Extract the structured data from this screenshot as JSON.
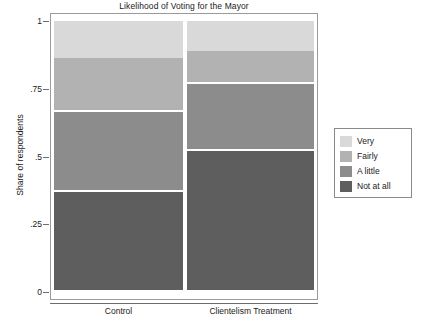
{
  "chart_data": {
    "type": "bar",
    "subtype": "stacked-100-percent",
    "title": "Likelihood of Voting for the Mayor",
    "xlabel": "",
    "ylabel": "Share of respondents",
    "categories": [
      "Control",
      "Clientelism Treatment"
    ],
    "ylim": [
      0,
      1
    ],
    "ytick_labels": [
      "1",
      ".75",
      ".5",
      ".25",
      "0"
    ],
    "ytick_values": [
      1,
      0.75,
      0.5,
      0.25,
      0
    ],
    "grid": false,
    "legend_position": "right",
    "stack_order_bottom_to_top": [
      "Not at all",
      "A little",
      "Fairly",
      "Very"
    ],
    "series": [
      {
        "name": "Very",
        "color": "#d9d9d9",
        "values": [
          0.135,
          0.109
        ]
      },
      {
        "name": "Fairly",
        "color": "#b2b2b2",
        "values": [
          0.201,
          0.125
        ]
      },
      {
        "name": "A little",
        "color": "#8c8c8c",
        "values": [
          0.295,
          0.244
        ]
      },
      {
        "name": "Not at all",
        "color": "#5e5e5e",
        "values": [
          0.369,
          0.522
        ]
      }
    ],
    "cumulative_boundaries": {
      "Control": [
        1.0,
        0.865,
        0.664,
        0.369,
        0.0
      ],
      "Clientelism Treatment": [
        1.0,
        0.891,
        0.766,
        0.522,
        0.0
      ]
    }
  },
  "legend": {
    "items": [
      {
        "label": "Very",
        "color": "#d9d9d9"
      },
      {
        "label": "Fairly",
        "color": "#b2b2b2"
      },
      {
        "label": "A little",
        "color": "#8c8c8c"
      },
      {
        "label": "Not at all",
        "color": "#5e5e5e"
      }
    ]
  },
  "axes": {
    "y_title": "Share of respondents",
    "y_ticks": [
      {
        "label": "1",
        "value": 1
      },
      {
        "label": ".75",
        "value": 0.75
      },
      {
        "label": ".5",
        "value": 0.5
      },
      {
        "label": ".25",
        "value": 0.25
      },
      {
        "label": "0",
        "value": 0
      }
    ],
    "x_ticks": [
      {
        "label": "Control"
      },
      {
        "label": "Clientelism Treatment"
      }
    ]
  }
}
